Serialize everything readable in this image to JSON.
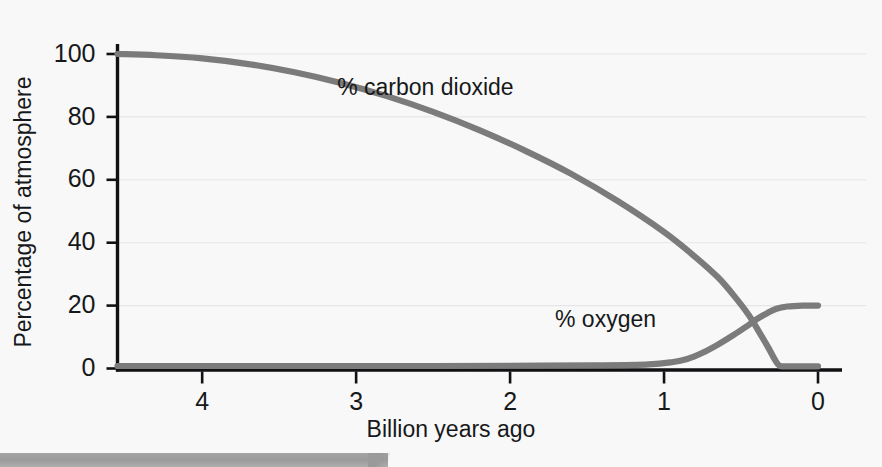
{
  "chart_data": {
    "type": "line",
    "title": "",
    "subtitle": "",
    "xlabel": "Billion years ago",
    "ylabel": "Percentage of atmosphere",
    "xlim": [
      4.55,
      0
    ],
    "ylim": [
      0,
      108
    ],
    "x_inverted": true,
    "grid": "horizontal gridlines at every y tick",
    "legend_position": "inline annotations on plot",
    "curve_color": "#7b7b7b",
    "axis_color": "#101113",
    "background_color": "#f8f8f8",
    "gridline_color": "#e6e6e8",
    "y_ticks": [
      {
        "value": 0,
        "label": "0"
      },
      {
        "value": 20,
        "label": "20"
      },
      {
        "value": 40,
        "label": "40"
      },
      {
        "value": 60,
        "label": "60"
      },
      {
        "value": 80,
        "label": "80"
      },
      {
        "value": 100,
        "label": "100"
      }
    ],
    "x_ticks": [
      {
        "value": 4,
        "label": "4"
      },
      {
        "value": 3,
        "label": "3"
      },
      {
        "value": 2,
        "label": "2"
      },
      {
        "value": 1,
        "label": "1"
      },
      {
        "value": 0,
        "label": "0"
      }
    ],
    "series": [
      {
        "name": "% carbon dioxide",
        "label": "% carbon dioxide",
        "label_x": 2.55,
        "label_y": 89,
        "color": "#7b7b7b",
        "x": [
          4.55,
          4.3,
          4.0,
          3.7,
          3.4,
          3.1,
          2.8,
          2.5,
          2.2,
          1.9,
          1.6,
          1.3,
          1.0,
          0.8,
          0.65,
          0.55,
          0.45,
          0.38,
          0.32,
          0.28,
          0.25,
          0.2,
          0.0
        ],
        "values": [
          100,
          99.6,
          98.6,
          96.8,
          94.2,
          90.8,
          86.6,
          81.6,
          75.8,
          69.2,
          61.8,
          53.2,
          43.4,
          35.6,
          29.0,
          23.4,
          17.0,
          11.4,
          6.4,
          2.8,
          0.9,
          0.7,
          0.7
        ]
      },
      {
        "name": "% oxygen",
        "label": "% oxygen",
        "label_x": 1.38,
        "label_y": 15,
        "color": "#7b7b7b",
        "x": [
          4.55,
          3.5,
          2.5,
          1.8,
          1.4,
          1.1,
          0.95,
          0.85,
          0.75,
          0.65,
          0.55,
          0.47,
          0.4,
          0.33,
          0.27,
          0.2,
          0.1,
          0.0
        ],
        "values": [
          0.8,
          0.8,
          0.8,
          0.9,
          1.0,
          1.3,
          2.0,
          3.0,
          5.0,
          7.6,
          10.6,
          13.2,
          15.6,
          17.6,
          19.0,
          19.7,
          20.0,
          20.0
        ]
      }
    ],
    "annotations": [
      {
        "text": "% carbon dioxide"
      },
      {
        "text": "% oxygen"
      }
    ]
  },
  "footer": {
    "bar_color": "#9a9a9a",
    "bar_label": ""
  }
}
